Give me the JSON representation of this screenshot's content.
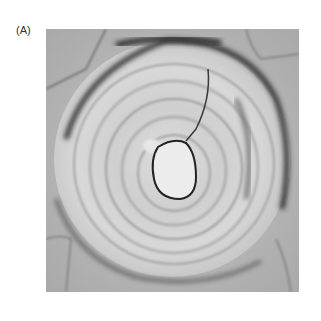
{
  "figure": {
    "panel_label": "(A)",
    "image": {
      "description": "Light micrograph of a sclereid (stone cell) with concentric layered secondary wall and central lumen",
      "background_tone": "#b8b8b8",
      "wall_tone": "#d6d6d6",
      "lumen_tone": "#e8e8e8",
      "outline_tone": "#333333"
    }
  }
}
